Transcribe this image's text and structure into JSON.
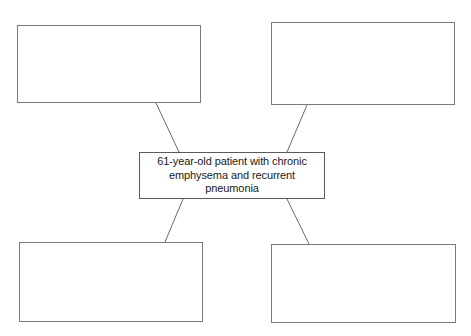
{
  "diagram": {
    "type": "concept-map",
    "background_color": "#ffffff",
    "border_color": "#6b6b6b",
    "text_color": "#1a1a1a",
    "center_node": {
      "id": "center-node",
      "text": "61-year-old patient with chronic emphysema and recurrent pneumonia",
      "lines": [
        "61-year-old patient with chronic",
        "emphysema and recurrent",
        "pneumonia"
      ],
      "x": 139,
      "y": 152,
      "width": 186,
      "height": 47
    },
    "nodes": [
      {
        "id": "node-top-left",
        "position": "top-left",
        "text": "",
        "x": 17,
        "y": 25,
        "width": 184,
        "height": 78
      },
      {
        "id": "node-top-right",
        "position": "top-right",
        "text": "",
        "x": 271,
        "y": 22,
        "width": 184,
        "height": 83
      },
      {
        "id": "node-bottom-left",
        "position": "bottom-left",
        "text": "",
        "x": 19,
        "y": 242,
        "width": 184,
        "height": 80
      },
      {
        "id": "node-bottom-right",
        "position": "bottom-right",
        "text": "",
        "x": 271,
        "y": 244,
        "width": 185,
        "height": 79
      }
    ],
    "connectors": [
      {
        "id": "connector-top-left",
        "from": "node-top-left",
        "to": "center-node",
        "x1": 156,
        "y1": 103,
        "x2": 179,
        "y2": 152
      },
      {
        "id": "connector-top-right",
        "from": "node-top-right",
        "to": "center-node",
        "x1": 307,
        "y1": 105,
        "x2": 287,
        "y2": 152
      },
      {
        "id": "connector-bottom-left",
        "from": "center-node",
        "to": "node-bottom-left",
        "x1": 183,
        "y1": 199,
        "x2": 165,
        "y2": 242
      },
      {
        "id": "connector-bottom-right",
        "from": "center-node",
        "to": "node-bottom-right",
        "x1": 287,
        "y1": 199,
        "x2": 309,
        "y2": 244
      }
    ]
  }
}
